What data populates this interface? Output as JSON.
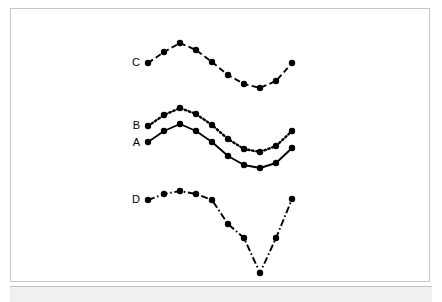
{
  "figure": {
    "background_color": "#ffffff",
    "frame_color": "#c8c8c8",
    "strip_color": "#f0f0f0",
    "line_color": "#000000",
    "marker_color": "#000000"
  },
  "chart_data": {
    "type": "line",
    "title": "",
    "subtitle": "",
    "xlabel": "",
    "ylabel": "",
    "xlim": [
      0,
      10
    ],
    "ylim": [
      0,
      10
    ],
    "grid": false,
    "axes_visible": false,
    "legend": "inline-labels-at-series-start",
    "x": [
      0,
      1,
      2,
      3,
      4,
      5,
      6,
      7,
      8,
      9
    ],
    "series": [
      {
        "name": "A",
        "label": "A",
        "linestyle": "solid",
        "marker": "filled-circle",
        "label_x": 140,
        "label_y": 146,
        "values": [
          4.55,
          5.55,
          6.25,
          6.02,
          5.08,
          3.75,
          2.78,
          2.45,
          2.92,
          4.25
        ],
        "points_px": [
          [
            148,
            142
          ],
          [
            164,
            131
          ],
          [
            180,
            124
          ],
          [
            196,
            131
          ],
          [
            212,
            142
          ],
          [
            228,
            156
          ],
          [
            244,
            165
          ],
          [
            260,
            168
          ],
          [
            276,
            163
          ],
          [
            292,
            148
          ]
        ]
      },
      {
        "name": "B",
        "label": "B",
        "linestyle": "dotted",
        "marker": "filled-circle",
        "label_x": 140,
        "label_y": 129,
        "values": [
          5.25,
          6.25,
          6.95,
          6.62,
          5.68,
          4.35,
          3.38,
          3.05,
          3.58,
          4.95
        ],
        "points_px": [
          [
            148,
            126
          ],
          [
            164,
            115
          ],
          [
            180,
            108
          ],
          [
            196,
            114
          ],
          [
            212,
            125
          ],
          [
            228,
            139
          ],
          [
            244,
            149
          ],
          [
            260,
            152
          ],
          [
            276,
            146
          ],
          [
            292,
            131
          ]
        ]
      },
      {
        "name": "C",
        "label": "C",
        "linestyle": "dashed",
        "marker": "filled-circle",
        "label_x": 140,
        "label_y": 66,
        "values": [
          7.65,
          8.45,
          9.05,
          8.62,
          7.7,
          6.35,
          5.28,
          4.85,
          5.42,
          6.72
        ],
        "points_px": [
          [
            148,
            63
          ],
          [
            164,
            52
          ],
          [
            180,
            43
          ],
          [
            196,
            50
          ],
          [
            212,
            62
          ],
          [
            228,
            75
          ],
          [
            244,
            84
          ],
          [
            260,
            88
          ],
          [
            276,
            81
          ],
          [
            292,
            63
          ]
        ]
      },
      {
        "name": "D",
        "label": "D",
        "linestyle": "dashdot",
        "marker": "filled-circle",
        "label_x": 140,
        "label_y": 203,
        "values": [
          2.72,
          3.08,
          3.25,
          3.08,
          2.72,
          1.38,
          0.52,
          0.05,
          0.72,
          2.75
        ],
        "points_px": [
          [
            148,
            200
          ],
          [
            164,
            194
          ],
          [
            180,
            191
          ],
          [
            196,
            194
          ],
          [
            212,
            200
          ],
          [
            228,
            224
          ],
          [
            244,
            238
          ],
          [
            260,
            273
          ],
          [
            276,
            238
          ],
          [
            292,
            199
          ]
        ]
      }
    ]
  }
}
